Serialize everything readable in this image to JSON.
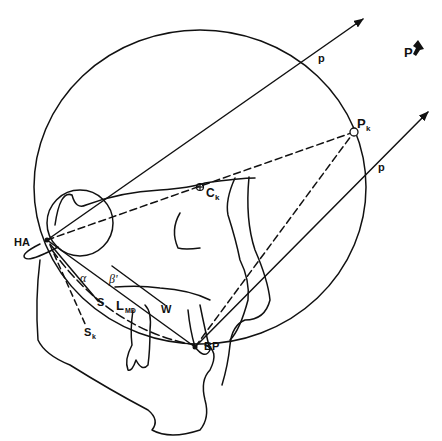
{
  "diagram": {
    "type": "geometric-anatomical line drawing",
    "stroke_color": "#111111",
    "background": "#ffffff",
    "labels": {
      "force_top": "p",
      "force_bottom": "p",
      "force_legend": "P",
      "p_k": "P",
      "p_k_sub": "k",
      "c_k": "C",
      "c_k_sub": "k",
      "hinge_axis": "HA",
      "bite_point": "BP",
      "alpha": "α",
      "beta": "β'",
      "s": "S",
      "s_k": "S",
      "s_k_sub": "k",
      "l_md": "L",
      "l_md_sub": "MD",
      "w": "W"
    },
    "points": {
      "HA": [
        47,
        240
      ],
      "BP": [
        195,
        347
      ],
      "Pk": [
        354,
        132
      ],
      "Ck": [
        200,
        187
      ]
    }
  }
}
